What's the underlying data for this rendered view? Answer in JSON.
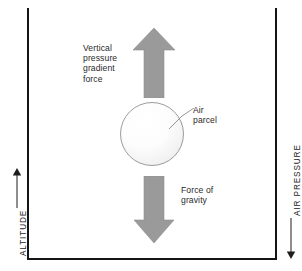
{
  "diagram": {
    "colors": {
      "arrow_fill": "#9a9a9a",
      "arrow_stroke": "#8c8c8c",
      "frame": "#151515",
      "label_text": "#2a2a2a",
      "axis_text": "#1d1d1d",
      "parcel_border": "#9c9c9c"
    },
    "labels": {
      "vertical_pressure_gradient_force": "Vertical\npressure\ngradient\nforce",
      "air_parcel": "Air\nparcel",
      "force_of_gravity": "Force of\ngravity"
    },
    "axes": {
      "left": {
        "label": "ALTITUDE",
        "direction": "up",
        "arrow_icon": "arrow-up-icon"
      },
      "right": {
        "label": "AIR PRESSURE",
        "direction": "down",
        "arrow_icon": "arrow-down-icon"
      }
    },
    "arrows": {
      "upward": {
        "icon": "arrow-up-icon",
        "represents": "Vertical pressure gradient force"
      },
      "downward": {
        "icon": "arrow-down-icon",
        "represents": "Force of gravity"
      }
    },
    "parcel": {
      "shape": "circle",
      "name": "air-parcel"
    }
  }
}
